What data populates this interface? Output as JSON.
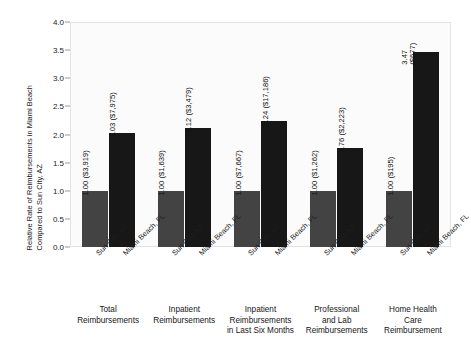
{
  "chart_data": {
    "type": "bar",
    "title": "",
    "subtitle": "",
    "xlabel": "",
    "ylabel_lines": [
      "Relative Rate of Reimbursements in Miami Beach",
      "Compared to Sun City, AZ"
    ],
    "ylabel": "Relative Rate of Reimbursements in Miami Beach Compared to Sun City, AZ",
    "ylim": [
      0.0,
      4.0
    ],
    "ytick_labels": [
      "0.0",
      "0.5",
      "1.0",
      "1.5",
      "2.0",
      "2.5",
      "3.0",
      "3.5",
      "4.0"
    ],
    "ytick_values": [
      0.0,
      0.5,
      1.0,
      1.5,
      2.0,
      2.5,
      3.0,
      3.5,
      4.0
    ],
    "grid": false,
    "legend": "none",
    "series": [
      {
        "name": "Sun City, AZ",
        "color": "#434343",
        "values": [
          1.0,
          1.0,
          1.0,
          1.0,
          1.0
        ],
        "value_labels": [
          "1.00  ($3,919)",
          "1.00  ($1,639)",
          "1.00  ($7,667)",
          "1.00  ($1,262)",
          "1.00  ($195)"
        ],
        "amounts": [
          "$3,919",
          "$1,639",
          "$7,667",
          "$1,262",
          "$195"
        ]
      },
      {
        "name": "Miami Beach, FL",
        "color": "#171717",
        "values": [
          2.03,
          2.12,
          2.24,
          1.76,
          3.47
        ],
        "value_labels": [
          "2.03  ($7,975)",
          "2.12  ($3,479)",
          "2.24  ($17,186)",
          "1.76  ($2,223)",
          "3.47\n($677)"
        ],
        "amounts": [
          "$7,975",
          "$3,479",
          "$17,186",
          "$2,223",
          "$677"
        ]
      }
    ],
    "categories": [
      "Total Reimbursements",
      "Inpatient Reimbursements",
      "Inpatient Reimbursements in Last Six Months",
      "Professional and Lab Reimbursements",
      "Home Health Care Reimbursement"
    ],
    "category_lines": [
      [
        "Total",
        "Reimbursements"
      ],
      [
        "Inpatient",
        "Reimbursements"
      ],
      [
        "Inpatient",
        "Reimbursements",
        "in Last Six Months"
      ],
      [
        "Professional",
        "and Lab",
        "Reimbursements"
      ],
      [
        "Home Health",
        "Care",
        "Reimbursement"
      ]
    ],
    "xtick_labels": [
      "Sun City, AZ",
      "Miami Beach, FL",
      "Sun City, AZ",
      "Miami Beach, FL",
      "Sun City, AZ",
      "Miami Beach, FL",
      "Sun City, AZ",
      "Miami Beach, FL",
      "Sun City, AZ",
      "Miami Beach, FL"
    ]
  }
}
